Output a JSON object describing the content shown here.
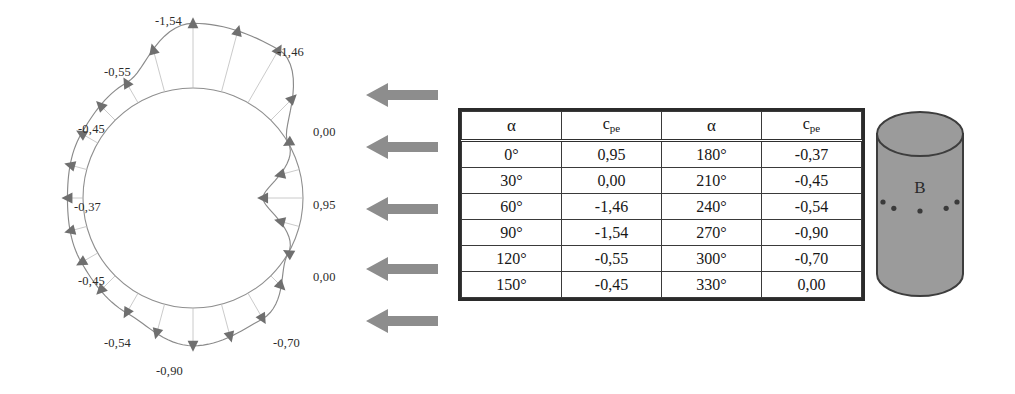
{
  "figure": {
    "kind": "wind-pressure-distribution-circular-cylinder",
    "colors": {
      "arrow_gray": "#8d8d8d",
      "cylinder_gray": "#9b9b9b",
      "curve_gray": "#8a8a8a",
      "marker_gray": "#6f6f6f",
      "table_border": "#2b2b2b",
      "text": "#1a1a1a"
    }
  },
  "polar": {
    "name": "pressure-distribution-diagram",
    "labels": [
      {
        "id": "top",
        "text": "-1,54",
        "x": 155,
        "y": 14,
        "angle_deg": 90
      },
      {
        "id": "upper-right",
        "text": "-1,46",
        "x": 277,
        "y": 45,
        "angle_deg": 60
      },
      {
        "id": "upper-left",
        "text": "-0,55",
        "x": 104,
        "y": 65,
        "angle_deg": 120
      },
      {
        "id": "left-upper",
        "text": "-0,45",
        "x": 78,
        "y": 122,
        "angle_deg": 150
      },
      {
        "id": "left",
        "text": "-0,37",
        "x": 74,
        "y": 200,
        "angle_deg": 180
      },
      {
        "id": "left-lower",
        "text": "-0,45",
        "x": 78,
        "y": 274,
        "angle_deg": 210
      },
      {
        "id": "lower-left",
        "text": "-0,54",
        "x": 104,
        "y": 336,
        "angle_deg": 240
      },
      {
        "id": "bottom",
        "text": "-0,90",
        "x": 156,
        "y": 364,
        "angle_deg": 270
      },
      {
        "id": "lower-right",
        "text": "-0,70",
        "x": 273,
        "y": 336,
        "angle_deg": 300
      },
      {
        "id": "right-lower",
        "text": "0,00",
        "x": 313,
        "y": 270,
        "angle_deg": 330
      },
      {
        "id": "right",
        "text": "0,95",
        "x": 313,
        "y": 198,
        "angle_deg": 0
      },
      {
        "id": "right-upper",
        "text": "0,00",
        "x": 313,
        "y": 125,
        "angle_deg": 30
      }
    ],
    "cpe_by_angle_deg": {
      "0": 0.95,
      "30": 0.0,
      "60": -1.46,
      "90": -1.54,
      "120": -0.55,
      "150": -0.45,
      "180": -0.37,
      "210": -0.45,
      "240": -0.54,
      "270": -0.9,
      "300": -0.7,
      "330": 0.0
    }
  },
  "wind": {
    "name": "wind-direction-arrows",
    "count": 5,
    "direction": "left",
    "tops": [
      12,
      64,
      126,
      186,
      238
    ]
  },
  "table": {
    "name": "cpe-table",
    "headers": [
      "α",
      "c",
      "α",
      "c"
    ],
    "header_subscript": "pe",
    "rows": [
      [
        "0°",
        "0,95",
        "180°",
        "-0,37"
      ],
      [
        "30°",
        "0,00",
        "210°",
        "-0,45"
      ],
      [
        "60°",
        "-1,46",
        "240°",
        "-0,54"
      ],
      [
        "90°",
        "-1,54",
        "270°",
        "-0,90"
      ],
      [
        "120°",
        "-0,55",
        "300°",
        "-0,70"
      ],
      [
        "150°",
        "-0,45",
        "330°",
        "0,00"
      ]
    ]
  },
  "cylinder": {
    "name": "cylinder-figure",
    "label": "B",
    "tap_points": 5
  }
}
